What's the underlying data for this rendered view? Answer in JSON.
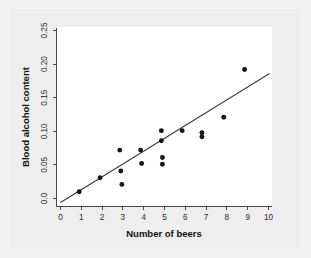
{
  "figure": {
    "background_color": "#f2f2f2",
    "inner_background_color": "#eeeeee",
    "plot_background_color": "#ffffff",
    "axis_color": "#4a4a4a",
    "point_color": "#161616",
    "line_color": "#3a3a3a"
  },
  "chart_data": {
    "type": "scatter",
    "title": "",
    "xlabel": "Number of beers",
    "ylabel": "Blood alcohol content",
    "xlim": [
      0,
      10.2
    ],
    "ylim": [
      -0.012,
      0.262
    ],
    "grid": false,
    "legend": null,
    "xticks": [
      0,
      1,
      2,
      3,
      4,
      5,
      6,
      7,
      8,
      9,
      10
    ],
    "xticklabels": [
      "0",
      "1",
      "2",
      "3",
      "4",
      "5",
      "6",
      "7",
      "8",
      "9",
      "10"
    ],
    "yticks": [
      0.0,
      0.05,
      0.1,
      0.15,
      0.2,
      0.25
    ],
    "yticklabels": [
      "0.0",
      "0.05",
      "0.10",
      "0.15",
      "0.20",
      "0.25"
    ],
    "tick_label_rotation": 90,
    "points": [
      {
        "x": 0.9,
        "y": 0.01
      },
      {
        "x": 1.9,
        "y": 0.031
      },
      {
        "x": 2.85,
        "y": 0.072
      },
      {
        "x": 2.9,
        "y": 0.041
      },
      {
        "x": 2.95,
        "y": 0.021
      },
      {
        "x": 3.85,
        "y": 0.072
      },
      {
        "x": 3.9,
        "y": 0.052
      },
      {
        "x": 4.85,
        "y": 0.101
      },
      {
        "x": 4.85,
        "y": 0.086
      },
      {
        "x": 4.9,
        "y": 0.061
      },
      {
        "x": 4.9,
        "y": 0.051
      },
      {
        "x": 5.85,
        "y": 0.101
      },
      {
        "x": 6.8,
        "y": 0.098
      },
      {
        "x": 6.8,
        "y": 0.092
      },
      {
        "x": 7.85,
        "y": 0.121
      },
      {
        "x": 8.85,
        "y": 0.192
      }
    ],
    "fit_line": {
      "type": "linear-regression",
      "x_start": 0.0,
      "y_start": -0.006,
      "x_end": 10.05,
      "y_end": 0.186
    }
  }
}
